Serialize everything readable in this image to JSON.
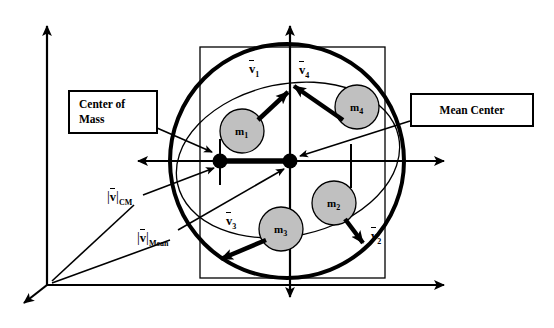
{
  "figure": {
    "type": "physics-diagram",
    "background": "#ffffff",
    "stroke_color": "#000000",
    "mass_fill_color": "#c0c0c0",
    "width": 554,
    "height": 328
  },
  "callouts": [
    {
      "id": "center-of-mass",
      "line1": "Center of",
      "line2": "Mass",
      "points_to": "cm-dot"
    },
    {
      "id": "mean-center",
      "text": "Mean Center",
      "points_to": "mean-dot"
    }
  ],
  "masses": [
    {
      "id": "m1",
      "label": "m",
      "sub": "1",
      "cx": 242,
      "cy": 131,
      "r": 22
    },
    {
      "id": "m2",
      "label": "m",
      "sub": "2",
      "cx": 334,
      "cy": 203,
      "r": 22
    },
    {
      "id": "m3",
      "label": "m",
      "sub": "3",
      "cx": 281,
      "cy": 229,
      "r": 22
    },
    {
      "id": "m4",
      "label": "m",
      "sub": "4",
      "cx": 357,
      "cy": 107,
      "r": 22
    }
  ],
  "velocity_vectors": [
    {
      "id": "v1",
      "label": "v",
      "sub": "1",
      "from_mass": "m1",
      "x1": 258,
      "y1": 120,
      "x2": 294,
      "y2": 87,
      "label_x": 249,
      "label_y": 62
    },
    {
      "id": "v2",
      "label": "v",
      "sub": "2",
      "from_mass": "m2",
      "x1": 345,
      "y1": 219,
      "x2": 367,
      "y2": 249,
      "label_x": 371,
      "label_y": 230
    },
    {
      "id": "v3",
      "label": "v",
      "sub": "3",
      "from_mass": "m3",
      "x1": 265,
      "y1": 240,
      "x2": 215,
      "y2": 262,
      "label_x": 226,
      "label_y": 214
    },
    {
      "id": "v4",
      "label": "v",
      "sub": "4",
      "from_mass": "m4",
      "x1": 340,
      "y1": 118,
      "x2": 288,
      "y2": 81,
      "label_x": 299,
      "label_y": 63
    }
  ],
  "points": [
    {
      "id": "cm-dot",
      "name": "center-of-mass-point",
      "x": 220,
      "y": 161,
      "r": 7
    },
    {
      "id": "mean-dot",
      "name": "mean-center-point",
      "x": 290,
      "y": 161,
      "r": 7
    }
  ],
  "magnitude_labels": [
    {
      "id": "v-cm",
      "label": "v",
      "sub": "CM",
      "x": 108,
      "y": 192
    },
    {
      "id": "v-mean",
      "label": "v",
      "sub": "Mean",
      "x": 138,
      "y": 233
    }
  ],
  "axes": {
    "outer_origin": {
      "x": 47,
      "y": 285
    },
    "outer_y_tip": {
      "x": 47,
      "y": 22
    },
    "outer_x_tip": {
      "x": 450,
      "y": 285
    },
    "outer_z_tip": {
      "x": 18,
      "y": 307
    },
    "inner_origin": {
      "x": 290,
      "y": 161
    },
    "inner_up_tip": {
      "x": 290,
      "y": 20
    },
    "inner_down_tip": {
      "x": 290,
      "y": 303
    },
    "inner_right_tip": {
      "x": 450,
      "y": 161
    },
    "inner_left_tip": {
      "x": 132,
      "y": 161
    }
  },
  "shapes": {
    "circle": {
      "cx": 287,
      "cy": 161,
      "r": 117,
      "stroke_width": 4
    },
    "square": {
      "x": 200,
      "y": 47,
      "width": 185,
      "height": 231,
      "stroke_width": 1.3
    },
    "ellipse": {
      "cx": 288,
      "cy": 160,
      "rx": 113,
      "ry": 76,
      "rotation": -12,
      "stroke_width": 1.3
    },
    "connector": {
      "x1": 220,
      "y1": 161,
      "x2": 290,
      "y2": 161,
      "stroke_width": 5
    }
  }
}
